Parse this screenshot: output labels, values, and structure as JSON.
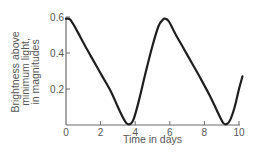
{
  "chart_data": {
    "type": "line",
    "title": "",
    "xlabel": "Time in days",
    "ylabel_lines": [
      "Brightness above",
      "minimum light,",
      "in magnitudes"
    ],
    "xlim": [
      0,
      10
    ],
    "ylim": [
      0,
      0.6
    ],
    "x_ticks": [
      0,
      2,
      4,
      6,
      8,
      10
    ],
    "x_tick_labels": [
      "0",
      "2",
      "4",
      "6",
      "8",
      "10"
    ],
    "y_ticks": [
      0.2,
      0.4,
      0.6
    ],
    "y_tick_labels": [
      "0.2",
      "0.4",
      "0.6"
    ],
    "grid": false,
    "legend": "none",
    "series": [
      {
        "name": "light curve",
        "color": "#1e1e1e",
        "x": [
          0,
          0.25,
          0.6,
          1.1,
          1.6,
          2.1,
          2.6,
          3.0,
          3.3,
          3.5,
          3.7,
          3.9,
          4.2,
          4.6,
          5.0,
          5.35,
          5.6,
          5.75,
          5.95,
          6.3,
          6.8,
          7.3,
          7.8,
          8.3,
          8.7,
          8.95,
          9.1,
          9.3,
          9.5,
          9.75,
          10.0,
          10.2
        ],
        "y": [
          0.59,
          0.585,
          0.53,
          0.44,
          0.355,
          0.27,
          0.185,
          0.1,
          0.04,
          0.01,
          0.005,
          0.03,
          0.13,
          0.29,
          0.44,
          0.55,
          0.585,
          0.59,
          0.575,
          0.51,
          0.425,
          0.34,
          0.255,
          0.165,
          0.085,
          0.035,
          0.01,
          0.005,
          0.03,
          0.1,
          0.2,
          0.27
        ]
      }
    ]
  }
}
